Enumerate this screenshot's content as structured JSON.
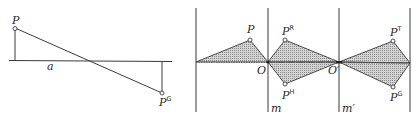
{
  "figure_left": {
    "points": {
      "P": {
        "label": "P",
        "sup": ""
      },
      "PG": {
        "label": "P",
        "sup": "G"
      }
    },
    "axis_label": "a"
  },
  "figure_right": {
    "points": {
      "P": {
        "label": "P",
        "sup": ""
      },
      "PR": {
        "label": "P",
        "sup": "R"
      },
      "PH": {
        "label": "P",
        "sup": "H"
      },
      "PT": {
        "label": "P",
        "sup": "T"
      },
      "PG": {
        "label": "P",
        "sup": "G"
      }
    },
    "centers": {
      "O": "O",
      "O2": "O′"
    },
    "mirror_labels": {
      "m": "m",
      "m2": "m′"
    },
    "hatch_color": "#b8b8b8",
    "line_color": "#3a3a3a"
  }
}
